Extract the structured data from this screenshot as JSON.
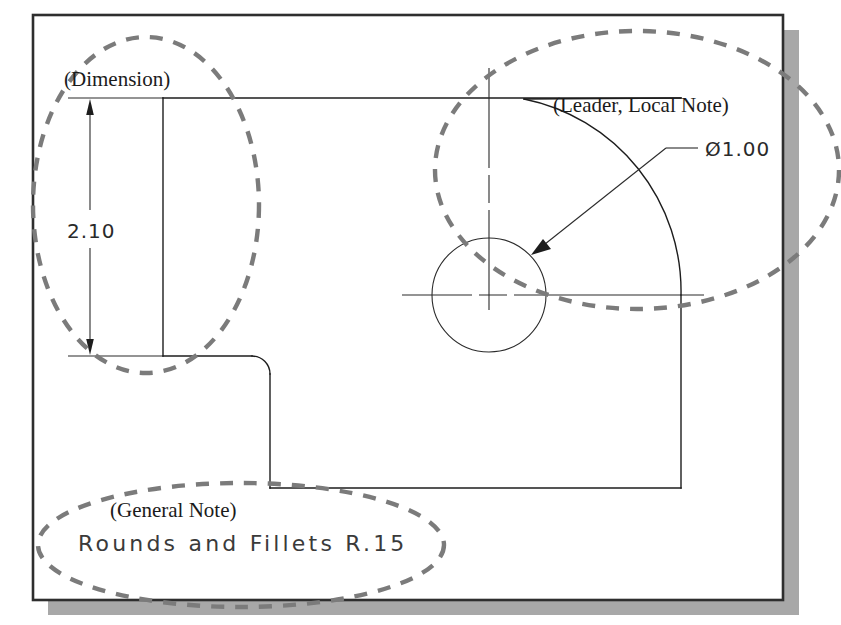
{
  "figure": {
    "background_color": "#ffffff",
    "frame": {
      "border_color": "#2e2e2e",
      "shadow_color": "#a8a8a8",
      "x": 33,
      "y": 15,
      "width": 750,
      "height": 585
    }
  },
  "annotations": {
    "dimension_callout": "(Dimension)",
    "leader_callout": "(Leader, Local Note)",
    "general_note_callout": "(General Note)"
  },
  "dimensions": {
    "vertical_dimension_value": "2.10",
    "diameter_note": "Ø1.00",
    "general_note_text": "Rounds and Fillets R.15"
  },
  "colors": {
    "object_line": "#1d1d1d",
    "thin_line": "#2b2b2b",
    "balloon_dashed": "#7b7b7b",
    "frame_border": "#2e2e2e",
    "frame_shadow": "#a8a8a8",
    "paper": "#ffffff"
  },
  "geometry": {
    "hole_center_x": 489,
    "hole_center_y": 295,
    "hole_radius": 57,
    "fillet_radius_px": 18,
    "large_arc_radius_px": 196
  }
}
